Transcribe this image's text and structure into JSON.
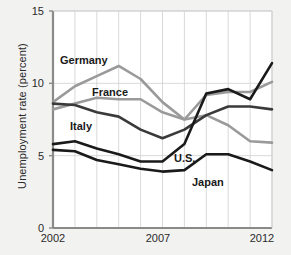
{
  "chart_data": {
    "type": "line",
    "title": "",
    "xlabel": "",
    "ylabel": "Unemployment rate (percent)",
    "xlim": [
      2002,
      2012
    ],
    "ylim": [
      0,
      15
    ],
    "yticks": [
      0,
      5,
      10,
      15
    ],
    "xticks": [
      2002,
      2007,
      2012
    ],
    "grid": true,
    "legend_position": "inline-labels",
    "x": [
      2002,
      2003,
      2004,
      2005,
      2006,
      2007,
      2008,
      2009,
      2010,
      2011,
      2012
    ],
    "series": [
      {
        "name": "Germany",
        "color": "#9a9a9a",
        "values": [
          8.7,
          9.8,
          10.5,
          11.2,
          10.3,
          8.7,
          7.5,
          7.8,
          7.1,
          6.0,
          5.9
        ]
      },
      {
        "name": "France",
        "color": "#9a9a9a",
        "values": [
          8.2,
          8.6,
          9.0,
          8.9,
          8.9,
          8.0,
          7.5,
          9.2,
          9.4,
          9.4,
          10.1
        ]
      },
      {
        "name": "Italy",
        "color": "#3a3a3a",
        "values": [
          8.6,
          8.5,
          8.0,
          7.7,
          6.8,
          6.2,
          6.8,
          7.8,
          8.4,
          8.4,
          8.2
        ]
      },
      {
        "name": "U.S.",
        "color": "#1a1a1a",
        "values": [
          5.8,
          6.0,
          5.5,
          5.1,
          4.6,
          4.6,
          5.8,
          9.3,
          9.6,
          8.9,
          11.4
        ]
      },
      {
        "name": "Japan",
        "color": "#1a1a1a",
        "values": [
          5.4,
          5.3,
          4.7,
          4.4,
          4.1,
          3.9,
          4.0,
          5.1,
          5.1,
          4.6,
          4.0
        ]
      }
    ],
    "inline_labels": [
      {
        "text": "Germany",
        "x_px": 60,
        "y_px": 54
      },
      {
        "text": "France",
        "x_px": 92,
        "y_px": 86
      },
      {
        "text": "Italy",
        "x_px": 70,
        "y_px": 120
      },
      {
        "text": "U.S.",
        "x_px": 174,
        "y_px": 152
      },
      {
        "text": "Japan",
        "x_px": 192,
        "y_px": 176
      }
    ],
    "axis_tick_labels_y": [
      "15",
      "10",
      "5",
      "0"
    ],
    "axis_tick_labels_x": [
      "2002",
      "2007",
      "2012"
    ]
  }
}
